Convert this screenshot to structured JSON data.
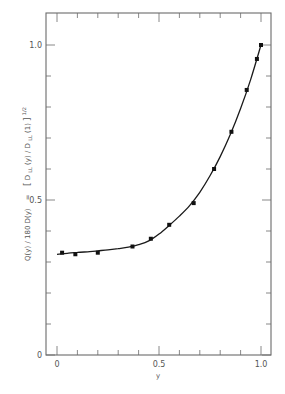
{
  "chart_data": {
    "type": "line",
    "title": "",
    "xlabel": "y",
    "ylabel": "Q(y) / 180 D(y)  =  [D_LL(y) / D_LL(1)]^1/2",
    "ylabel_parts": {
      "left": "Q(y) / 180 D(y)",
      "eq": "=",
      "bracket_open": "[",
      "num": "D",
      "num_sub": "LL",
      "num_arg": "(y) / ",
      "den": "D",
      "den_sub": "LL",
      "den_arg": "(1)",
      "bracket_close": "]",
      "exp": "1/2"
    },
    "xlim": [
      0,
      1.0
    ],
    "ylim": [
      0,
      1.0
    ],
    "x_ticks": [
      0,
      0.1,
      0.2,
      0.3,
      0.4,
      0.5,
      0.6,
      0.7,
      0.8,
      0.9,
      1.0
    ],
    "x_tick_labels": [
      {
        "value": 0,
        "label": "0"
      },
      {
        "value": 0.5,
        "label": "0.5"
      },
      {
        "value": 1.0,
        "label": "1.0"
      }
    ],
    "y_ticks": [
      0,
      0.1,
      0.2,
      0.3,
      0.4,
      0.5,
      0.6,
      0.7,
      0.8,
      0.9,
      1.0
    ],
    "y_tick_labels": [
      {
        "value": 0,
        "label": "0"
      },
      {
        "value": 0.5,
        "label": "0.5"
      },
      {
        "value": 1.0,
        "label": "1.0"
      }
    ],
    "grid": false,
    "legend": null,
    "series": [
      {
        "name": "data points",
        "style": "markers",
        "x": [
          0.025,
          0.09,
          0.2,
          0.37,
          0.46,
          0.55,
          0.67,
          0.77,
          0.855,
          0.93,
          0.98,
          1.0
        ],
        "y": [
          0.33,
          0.325,
          0.33,
          0.35,
          0.375,
          0.42,
          0.49,
          0.6,
          0.72,
          0.855,
          0.955,
          1.0
        ]
      },
      {
        "name": "fitted curve",
        "style": "line",
        "x": [
          0,
          0.05,
          0.1,
          0.15,
          0.2,
          0.25,
          0.3,
          0.35,
          0.4,
          0.45,
          0.5,
          0.55,
          0.6,
          0.65,
          0.7,
          0.75,
          0.8,
          0.85,
          0.9,
          0.95,
          1.0
        ],
        "y": [
          0.325,
          0.328,
          0.331,
          0.333,
          0.336,
          0.339,
          0.343,
          0.348,
          0.356,
          0.368,
          0.39,
          0.418,
          0.448,
          0.482,
          0.525,
          0.578,
          0.64,
          0.712,
          0.795,
          0.89,
          1.0
        ]
      }
    ]
  }
}
